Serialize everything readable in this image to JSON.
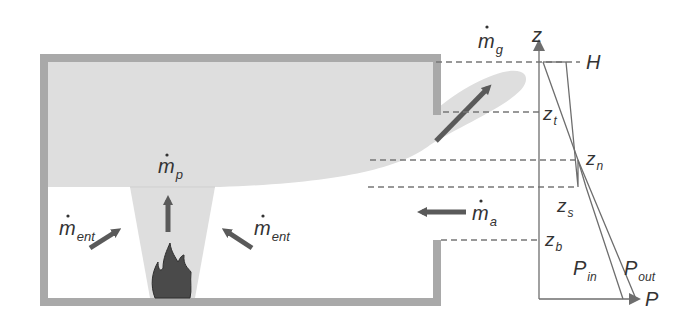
{
  "diagram": {
    "colors": {
      "wall": "#a9a9a9",
      "smoke": "#dedede",
      "arrow": "#5a5a5a",
      "line": "#6e6e6e",
      "text": "#333333",
      "flame": "#4a4a4a"
    },
    "labels": {
      "m_g": {
        "base": "m",
        "sub": "g",
        "dot": true
      },
      "m_p": {
        "base": "m",
        "sub": "p",
        "dot": true
      },
      "m_ent_left": {
        "base": "m",
        "sub": "ent",
        "dot": true
      },
      "m_ent_right": {
        "base": "m",
        "sub": "ent",
        "dot": true
      },
      "m_a": {
        "base": "m",
        "sub": "a",
        "dot": true
      }
    },
    "axis": {
      "z_label": "z",
      "p_label": "P",
      "levels": [
        {
          "id": "H",
          "base": "H",
          "sub": ""
        },
        {
          "id": "z_t",
          "base": "z",
          "sub": "t"
        },
        {
          "id": "z_n",
          "base": "z",
          "sub": "n"
        },
        {
          "id": "z_s",
          "base": "z",
          "sub": "s"
        },
        {
          "id": "z_b",
          "base": "z",
          "sub": "b"
        }
      ],
      "curves": [
        {
          "id": "P_in",
          "base": "P",
          "sub": "in"
        },
        {
          "id": "P_out",
          "base": "P",
          "sub": "out"
        }
      ]
    }
  }
}
